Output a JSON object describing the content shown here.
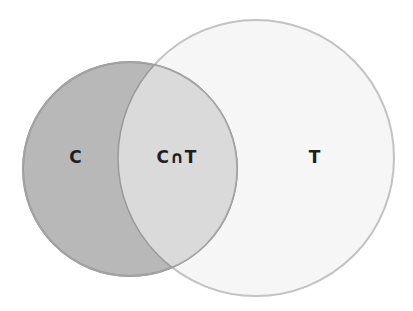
{
  "diagram": {
    "type": "venn",
    "sets": [
      {
        "id": "C",
        "label": "C",
        "fill": "#b9b9b9",
        "stroke": "#8a8a8a"
      },
      {
        "id": "T",
        "label": "T",
        "fill": "#f6f6f6",
        "stroke": "#bdbdbd"
      }
    ],
    "intersection": {
      "label": "C∩T",
      "fill": "#d9d9d9"
    }
  }
}
